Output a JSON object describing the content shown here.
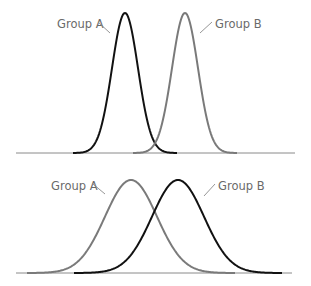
{
  "chart_data": [
    {
      "type": "line",
      "title": "",
      "description": "Two non-overlapping narrow normal distributions (low variance)",
      "xlabel": "",
      "ylabel": "",
      "grid": false,
      "series": [
        {
          "name": "Group A",
          "color": "#111111",
          "mean_px": 125,
          "sd_px": 13,
          "peak_y_px": 13
        },
        {
          "name": "Group B",
          "color": "#7a7a7a",
          "mean_px": 185,
          "sd_px": 13,
          "peak_y_px": 13
        }
      ],
      "baseline": {
        "y_px": 153,
        "x_start_px": 16,
        "x_end_px": 295
      }
    },
    {
      "type": "line",
      "title": "",
      "description": "Two overlapping wide normal distributions (high variance)",
      "xlabel": "",
      "ylabel": "",
      "grid": false,
      "series": [
        {
          "name": "Group A",
          "color": "#7a7a7a",
          "mean_px": 131,
          "sd_px": 26,
          "peak_y_px": 180
        },
        {
          "name": "Group B",
          "color": "#111111",
          "mean_px": 178,
          "sd_px": 26,
          "peak_y_px": 180
        }
      ],
      "baseline": {
        "y_px": 273,
        "x_start_px": 16,
        "x_end_px": 292
      }
    }
  ],
  "labels": {
    "top_a": "Group A",
    "top_b": "Group B",
    "bottom_a": "Group A",
    "bottom_b": "Group B"
  }
}
